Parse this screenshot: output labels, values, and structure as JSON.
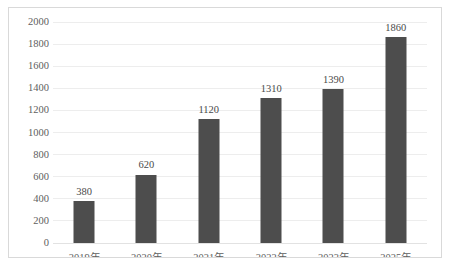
{
  "chart_data": {
    "type": "bar",
    "title": "",
    "subtitle": "",
    "xlabel": "",
    "ylabel": "",
    "categories": [
      "2019年",
      "2020年",
      "2021年",
      "2022年",
      "2023年",
      "2025年"
    ],
    "values": [
      380,
      620,
      1120,
      1310,
      1390,
      1860
    ],
    "data_labels": [
      "380",
      "620",
      "1120",
      "1310",
      "1390",
      "1860"
    ],
    "ylim": [
      0,
      2000
    ],
    "ytick_values": [
      0,
      200,
      400,
      600,
      800,
      1000,
      1200,
      1400,
      1600,
      1800,
      2000
    ],
    "ytick_labels": [
      "0",
      "200",
      "400",
      "600",
      "800",
      "1000",
      "1200",
      "1400",
      "1600",
      "1800",
      "2000"
    ],
    "grid": true,
    "grid_axis": "y",
    "legend": false,
    "legend_position": "none",
    "series": [
      {
        "name": "",
        "values": [
          380,
          620,
          1120,
          1310,
          1390,
          1860
        ]
      }
    ]
  },
  "style": {
    "bar_color": "#4d4d4d",
    "grid_color": "#ededed",
    "border_color": "#d9d9d9",
    "background": "#ffffff",
    "text_color": "#5e5e5e",
    "label_color": "#4a4a4a"
  }
}
